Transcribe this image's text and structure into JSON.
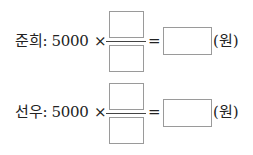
{
  "problems": [
    {
      "name": "준희",
      "label": "준희: 5000",
      "operator": "×",
      "equals": "=",
      "numerator": "",
      "denominator": "",
      "answer": "",
      "unit": "(원)"
    },
    {
      "name": "선우",
      "label": "선우: 5000",
      "operator": "×",
      "equals": "=",
      "numerator": "",
      "denominator": "",
      "answer": "",
      "unit": "(원)"
    }
  ]
}
